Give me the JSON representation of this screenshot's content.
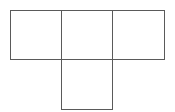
{
  "diagram": {
    "type": "net",
    "stroke_color": "#5a5a5a",
    "background": "#ffffff",
    "squares": [
      {
        "id": "top-left",
        "x": 10,
        "y": 10,
        "size": 52
      },
      {
        "id": "top-middle",
        "x": 61,
        "y": 10,
        "size": 52
      },
      {
        "id": "top-right",
        "x": 112,
        "y": 10,
        "size": 52
      },
      {
        "id": "bottom-middle",
        "x": 61,
        "y": 59,
        "size": 51
      }
    ]
  }
}
